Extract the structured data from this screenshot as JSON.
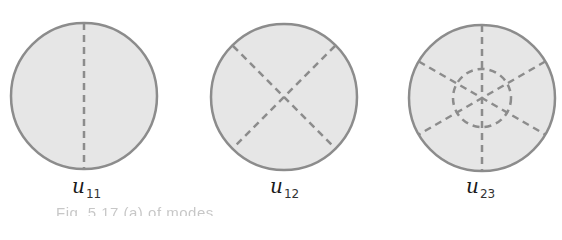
{
  "figure": {
    "colors": {
      "fill": "#e6e6e6",
      "stroke": "#8c8c8c",
      "dash": "#8c8c8c"
    },
    "modes": [
      {
        "id": "u11",
        "symbol": "u",
        "subscript": "11",
        "nodal_diameters": 1,
        "nodal_circles": 0
      },
      {
        "id": "u12",
        "symbol": "u",
        "subscript": "12",
        "nodal_diameters": 2,
        "nodal_circles": 0
      },
      {
        "id": "u23",
        "symbol": "u",
        "subscript": "23",
        "nodal_diameters": 3,
        "nodal_circles": 1
      }
    ],
    "caption": "Fig. 5.17   (a)   of   modes"
  }
}
